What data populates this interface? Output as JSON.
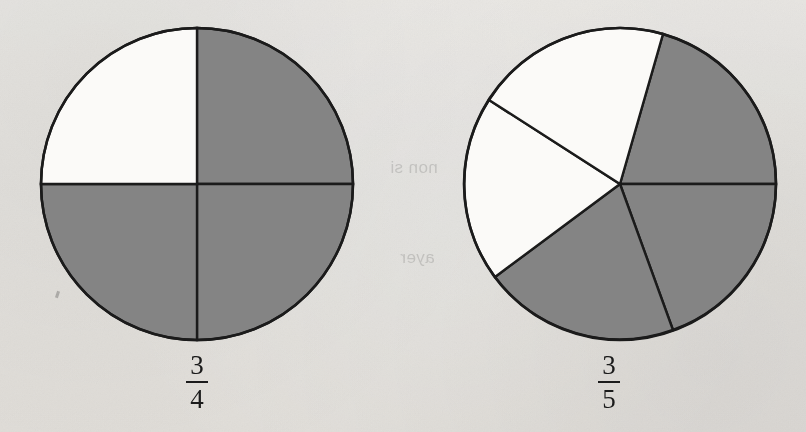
{
  "page": {
    "width": 806,
    "height": 432,
    "background_color": "#f2f1ef",
    "ink_color": "#1b1b1b",
    "shaded_color": "#808080"
  },
  "figures": [
    {
      "id": "fraction-circle-three-quarters",
      "label_numerator": "3",
      "label_denominator": "4",
      "label_text": "3/4",
      "center_x": 197,
      "center_y": 184,
      "radius": 156,
      "total_parts": 4,
      "shaded_parts": 3,
      "sectors": [
        {
          "name": "upper-left",
          "start_deg": 90,
          "end_deg": 180,
          "shaded": false
        },
        {
          "name": "upper-right",
          "start_deg": 0,
          "end_deg": 90,
          "shaded": true
        },
        {
          "name": "lower-right",
          "start_deg": -90,
          "end_deg": 0,
          "shaded": true
        },
        {
          "name": "lower-left",
          "start_deg": 180,
          "end_deg": 270,
          "shaded": true
        }
      ]
    },
    {
      "id": "fraction-circle-three-fifths",
      "label_numerator": "3",
      "label_denominator": "5",
      "label_text": "3/5",
      "center_x": 620,
      "center_y": 184,
      "radius": 156,
      "total_parts": 5,
      "shaded_parts": 3,
      "sectors": [
        {
          "name": "top-right",
          "start_deg": 0,
          "end_deg": 74,
          "shaded": true
        },
        {
          "name": "lower-right",
          "start_deg": -70,
          "end_deg": 0,
          "shaded": true
        },
        {
          "name": "bottom-left",
          "start_deg": -143,
          "end_deg": -70,
          "shaded": true
        },
        {
          "name": "left",
          "start_deg": 143,
          "end_deg": 217,
          "shaded": false
        },
        {
          "name": "upper-left",
          "start_deg": 74,
          "end_deg": 143,
          "shaded": false
        }
      ]
    }
  ],
  "bleed_through": [
    {
      "text": "passed",
      "x": 262,
      "y": 152
    },
    {
      "text": "non si",
      "x": 390,
      "y": 158
    },
    {
      "text": "in the",
      "x": 520,
      "y": 160
    },
    {
      "text": "so flo",
      "x": 205,
      "y": 238
    },
    {
      "text": "ayer",
      "x": 400,
      "y": 248
    }
  ]
}
